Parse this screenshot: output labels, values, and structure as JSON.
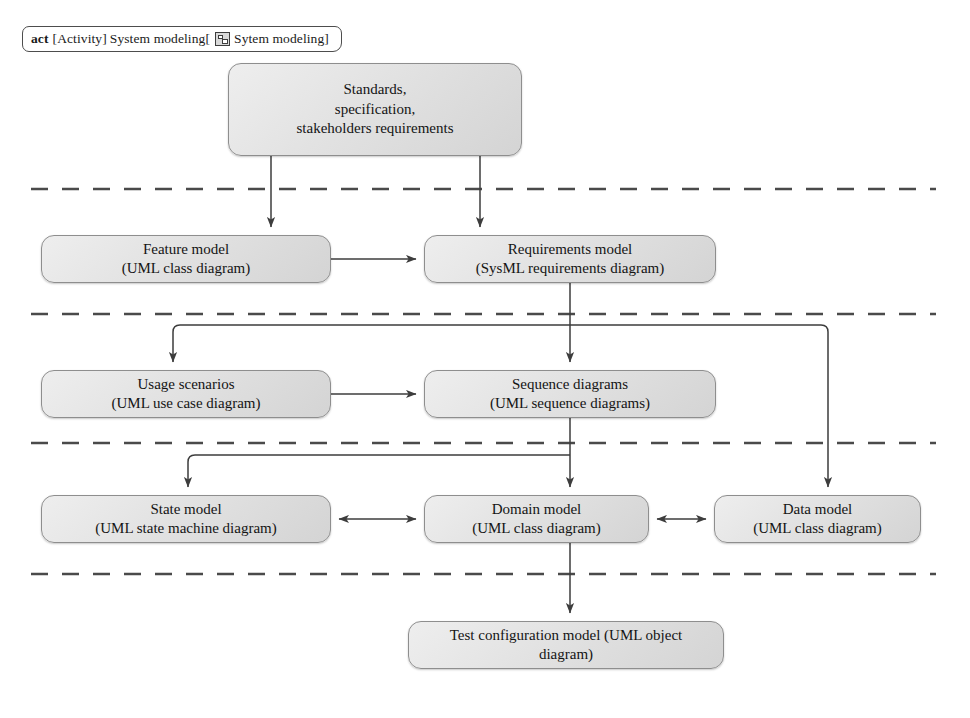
{
  "frame": {
    "keyword": "act",
    "type_label": "[Activity]",
    "name": "System modeling[",
    "icon": "activity-diagram-icon",
    "inner_name": "Sytem modeling]"
  },
  "colors": {
    "node_border": "#8e8e8e",
    "node_fill_light": "#eeeeee",
    "node_fill_dark": "#d4d4d4",
    "connector": "#4a4a4a",
    "lane_divider": "#4a4a4a",
    "frame_border": "#4d4d4d",
    "text": "#141414"
  },
  "nodes": [
    {
      "id": "standards",
      "name": "standards-node",
      "lines": [
        "Standards,",
        "specification,",
        "stakeholders requirements"
      ],
      "x": 228,
      "y": 63,
      "w": 294,
      "h": 93
    },
    {
      "id": "feature_model",
      "name": "feature-model-node",
      "lines": [
        "Feature model",
        "(UML class diagram)"
      ],
      "x": 41,
      "y": 235,
      "w": 290,
      "h": 48
    },
    {
      "id": "requirements_model",
      "name": "requirements-model-node",
      "lines": [
        "Requirements model",
        "(SysML requirements diagram)"
      ],
      "x": 424,
      "y": 235,
      "w": 292,
      "h": 48
    },
    {
      "id": "usage_scenarios",
      "name": "usage-scenarios-node",
      "lines": [
        "Usage scenarios",
        "(UML use case diagram)"
      ],
      "x": 41,
      "y": 370,
      "w": 290,
      "h": 48
    },
    {
      "id": "sequence_diagrams",
      "name": "sequence-diagrams-node",
      "lines": [
        "Sequence diagrams",
        "(UML sequence diagrams)"
      ],
      "x": 424,
      "y": 370,
      "w": 292,
      "h": 48
    },
    {
      "id": "state_model",
      "name": "state-model-node",
      "lines": [
        "State model",
        "(UML state machine diagram)"
      ],
      "x": 41,
      "y": 495,
      "w": 290,
      "h": 48
    },
    {
      "id": "domain_model",
      "name": "domain-model-node",
      "lines": [
        "Domain model",
        "(UML class diagram)"
      ],
      "x": 424,
      "y": 495,
      "w": 225,
      "h": 48
    },
    {
      "id": "data_model",
      "name": "data-model-node",
      "lines": [
        "Data model",
        "(UML class diagram)"
      ],
      "x": 714,
      "y": 495,
      "w": 207,
      "h": 48
    },
    {
      "id": "test_configuration_model",
      "name": "test-configuration-model-node",
      "lines": [
        "Test configuration model (UML object",
        "diagram)"
      ],
      "x": 408,
      "y": 621,
      "w": 316,
      "h": 48
    }
  ],
  "lane_dividers": [
    {
      "name": "lane-divider-1",
      "y": 189,
      "x1": 31,
      "x2": 936
    },
    {
      "name": "lane-divider-2",
      "y": 314,
      "x1": 31,
      "x2": 936
    },
    {
      "name": "lane-divider-3",
      "y": 443,
      "x1": 31,
      "x2": 936
    },
    {
      "name": "lane-divider-4",
      "y": 574,
      "x1": 31,
      "x2": 936
    }
  ],
  "connectors": [
    {
      "name": "connector-standards-to-feature-model",
      "from": "standards",
      "to": "feature_model",
      "arrows": 1
    },
    {
      "name": "connector-standards-to-requirements-model",
      "from": "standards",
      "to": "requirements_model",
      "arrows": 1
    },
    {
      "name": "connector-feature-model-to-requirements-model",
      "from": "feature_model",
      "to": "requirements_model",
      "arrows": 1
    },
    {
      "name": "connector-requirements-model-to-usage-scenarios",
      "from": "requirements_model",
      "to": "usage_scenarios",
      "arrows": 1
    },
    {
      "name": "connector-requirements-model-to-sequence-diagrams",
      "from": "requirements_model",
      "to": "sequence_diagrams",
      "arrows": 1
    },
    {
      "name": "connector-requirements-model-to-data-model",
      "from": "requirements_model",
      "to": "data_model",
      "arrows": 1
    },
    {
      "name": "connector-usage-scenarios-to-sequence-diagrams",
      "from": "usage_scenarios",
      "to": "sequence_diagrams",
      "arrows": 1
    },
    {
      "name": "connector-sequence-diagrams-to-state-model",
      "from": "sequence_diagrams",
      "to": "state_model",
      "arrows": 1
    },
    {
      "name": "connector-sequence-diagrams-to-domain-model",
      "from": "sequence_diagrams",
      "to": "domain_model",
      "arrows": 1
    },
    {
      "name": "connector-state-model-domain-model",
      "from": "state_model",
      "to": "domain_model",
      "arrows": 2
    },
    {
      "name": "connector-domain-model-data-model",
      "from": "domain_model",
      "to": "data_model",
      "arrows": 2
    },
    {
      "name": "connector-domain-model-to-test-configuration-model",
      "from": "domain_model",
      "to": "test_configuration_model",
      "arrows": 1
    }
  ]
}
